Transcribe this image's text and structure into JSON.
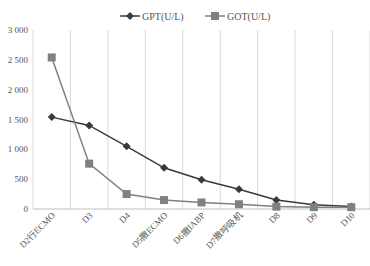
{
  "chart_data": {
    "type": "line",
    "title": "",
    "xlabel": "",
    "ylabel": "",
    "categories": [
      "D2行ECMO",
      "D3",
      "D4",
      "D5撤ECMO",
      "D6撤IABP",
      "D7撤呼吸机",
      "D8",
      "D9",
      "D10"
    ],
    "series": [
      {
        "name": "GPT(U/L)",
        "marker": "diamond",
        "color": "#3a3a3a",
        "values": [
          1540,
          1400,
          1050,
          690,
          490,
          330,
          150,
          70,
          40
        ]
      },
      {
        "name": "GOT(U/L)",
        "marker": "square",
        "color": "#808080",
        "values": [
          2540,
          760,
          250,
          150,
          110,
          80,
          40,
          30,
          30
        ]
      }
    ],
    "ylim": [
      0,
      3000
    ],
    "yticks": [
      "0",
      "500",
      "1 000",
      "1 500",
      "2 000",
      "2 500",
      "3 000"
    ],
    "grid": "vertical",
    "legend_position": "top"
  }
}
